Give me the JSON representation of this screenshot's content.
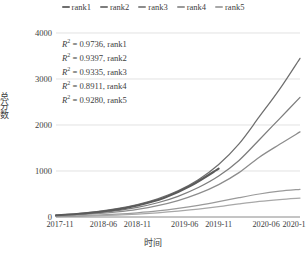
{
  "chart_data": {
    "type": "line",
    "title": "",
    "xlabel": "时间",
    "ylabel": "总分数",
    "xlim": [
      0,
      36
    ],
    "ylim": [
      0,
      4000
    ],
    "grid": true,
    "legend_position": "top-center",
    "x_tick_labels": [
      "2017-11",
      "2018-06",
      "2018-11",
      "2019-06",
      "2019-11",
      "2020-06",
      "2020-11"
    ],
    "x_tick_values": [
      0,
      7,
      12,
      19,
      24,
      31,
      36
    ],
    "y_tick_labels": [
      "0",
      "1000",
      "2000",
      "3000",
      "4000"
    ],
    "y_tick_values": [
      0,
      1000,
      2000,
      3000,
      4000
    ],
    "series": [
      {
        "name": "rank1",
        "color": "#6e6e6e",
        "r_squared": 0.9736,
        "x": [
          0,
          3,
          6,
          9,
          12,
          15,
          18,
          21,
          24,
          27,
          30,
          33,
          36
        ],
        "values": [
          40,
          70,
          115,
          180,
          270,
          395,
          570,
          810,
          1140,
          1590,
          2180,
          2780,
          3450
        ]
      },
      {
        "name": "rank2",
        "color": "#7d7d7d",
        "r_squared": 0.9397,
        "x": [
          0,
          3,
          6,
          9,
          12,
          15,
          18,
          21,
          24,
          27,
          30,
          33,
          36
        ],
        "values": [
          30,
          55,
          90,
          140,
          210,
          310,
          450,
          640,
          890,
          1230,
          1680,
          2140,
          2600
        ]
      },
      {
        "name": "rank3",
        "color": "#8c8c8c",
        "r_squared": 0.9335,
        "x": [
          0,
          3,
          6,
          9,
          12,
          15,
          18,
          21,
          24,
          27,
          30,
          33,
          36
        ],
        "values": [
          25,
          45,
          72,
          112,
          168,
          248,
          358,
          508,
          705,
          965,
          1300,
          1580,
          1850
        ]
      },
      {
        "name": "rank4",
        "color": "#9a9a9a",
        "r_squared": 0.8911,
        "x": [
          0,
          3,
          6,
          9,
          12,
          15,
          18,
          21,
          24,
          27,
          30,
          33,
          36
        ],
        "values": [
          15,
          25,
          40,
          62,
          92,
          132,
          186,
          252,
          332,
          420,
          500,
          560,
          600
        ]
      },
      {
        "name": "rank5",
        "color": "#a8a8a8",
        "r_squared": 0.928,
        "x": [
          0,
          3,
          6,
          9,
          12,
          15,
          18,
          21,
          24,
          27,
          30,
          33,
          36
        ],
        "values": [
          10,
          18,
          28,
          43,
          64,
          92,
          128,
          172,
          224,
          285,
          340,
          380,
          410
        ]
      },
      {
        "name": "rank1-fit-segment",
        "color": "#5a5a5a",
        "r_squared": null,
        "x": [
          0,
          4,
          8,
          12,
          16,
          20,
          24
        ],
        "values": [
          35,
          75,
          140,
          250,
          420,
          690,
          1050
        ]
      }
    ],
    "annotations": [
      {
        "text": "R² = 0.9736, rank1",
        "r2_value": "0.9736",
        "series": "rank1"
      },
      {
        "text": "R² = 0.9397, rank2",
        "r2_value": "0.9397",
        "series": "rank2"
      },
      {
        "text": "R² = 0.9335, rank3",
        "r2_value": "0.9335",
        "series": "rank3"
      },
      {
        "text": "R² = 0.8911, rank4",
        "r2_value": "0.8911",
        "series": "rank4"
      },
      {
        "text": "R² = 0.9280, rank5",
        "r2_value": "0.9280",
        "series": "rank5"
      }
    ]
  },
  "legend": {
    "items": [
      {
        "label": "rank1",
        "color": "#6e6e6e"
      },
      {
        "label": "rank2",
        "color": "#7d7d7d"
      },
      {
        "label": "rank3",
        "color": "#8c8c8c"
      },
      {
        "label": "rank4",
        "color": "#9a9a9a"
      },
      {
        "label": "rank5",
        "color": "#a8a8a8"
      }
    ]
  },
  "axes": {
    "y_title": "总分数",
    "x_title": "时间",
    "y_ticks": [
      "4000",
      "3000",
      "2000",
      "1000",
      "0"
    ],
    "x_ticks": [
      "2017-11",
      "2018-06",
      "2018-11",
      "2019-06",
      "2019-11",
      "2020-06",
      "2020-11"
    ]
  },
  "annotation_rows": [
    {
      "prefix": "R",
      "exp": "2",
      "eq": " = 0.9736, rank1"
    },
    {
      "prefix": "R",
      "exp": "2",
      "eq": " = 0.9397, rank2"
    },
    {
      "prefix": "R",
      "exp": "2",
      "eq": " = 0.9335, rank3"
    },
    {
      "prefix": "R",
      "exp": "2",
      "eq": " = 0.8911, rank4"
    },
    {
      "prefix": "R",
      "exp": "2",
      "eq": " = 0.9280, rank5"
    }
  ]
}
